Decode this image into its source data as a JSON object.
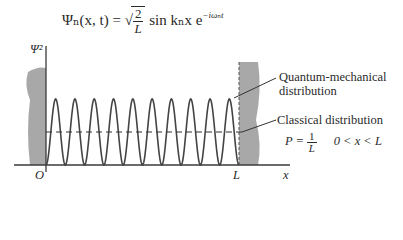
{
  "equation": {
    "lhs": "Ψₙ(x, t)",
    "equals": "=",
    "sqrt_num": "2",
    "sqrt_den": "L",
    "rhs": "sin kₙx e",
    "exponent": "−iωₙt"
  },
  "axes": {
    "y_label": "Ψ²",
    "x_label": "x",
    "origin_label": "O",
    "L_label": "L"
  },
  "annotations": {
    "quantum_line1": "Quantum-mechanical",
    "quantum_line2": "distribution",
    "classical": "Classical distribution",
    "P_eq": "P =",
    "P_num": "1",
    "P_den": "L",
    "range": "0 < x < L"
  },
  "chart_data": {
    "type": "line",
    "title": "",
    "xlabel": "x",
    "ylabel": "Ψ²",
    "series": [
      {
        "name": "Quantum-mechanical distribution",
        "function": "(2/L) sin²(nπx/L)",
        "n": 10,
        "peaks": 10
      },
      {
        "name": "Classical distribution",
        "function": "P = 1/L",
        "style": "dashed",
        "relative_height": 0.5
      }
    ],
    "x_range": [
      "0",
      "L"
    ],
    "walls": [
      "x = 0",
      "x = L"
    ]
  },
  "colors": {
    "ink": "#3a3a3a",
    "wall": "#a8a8a8"
  }
}
